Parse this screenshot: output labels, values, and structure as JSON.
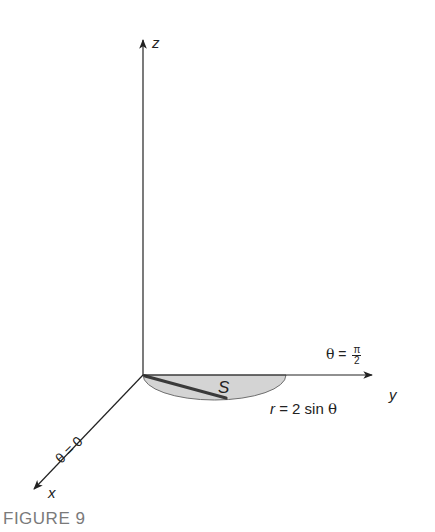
{
  "figure": {
    "caption": "FIGURE 9",
    "axes": {
      "z": "z",
      "y": "y",
      "x": "x"
    },
    "annotations": {
      "theta_pi_over_2": {
        "theta": "θ",
        "eq": " = ",
        "num": "π",
        "den": "2"
      },
      "theta_zero": "θ = 0",
      "region": "S",
      "curve_r": "r",
      "curve_rest": " = 2 sin ",
      "curve_theta": "θ"
    },
    "colors": {
      "axis": "#222222",
      "region_fill": "#d4d4d4",
      "region_edge": "#6e6e6e",
      "radius_line": "#3a3a3a",
      "caption": "#7a7a7a"
    }
  }
}
